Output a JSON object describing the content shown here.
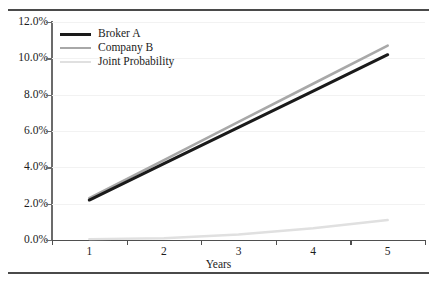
{
  "chart_data": {
    "type": "line",
    "title": "",
    "xlabel": "Years",
    "ylabel": "",
    "categories": [
      "1",
      "2",
      "3",
      "4",
      "5"
    ],
    "x": [
      1,
      2,
      3,
      4,
      5
    ],
    "ylim": [
      0,
      12
    ],
    "ytick_labels": [
      "12.0%",
      "10.0%",
      "8.0%",
      "6.0%",
      "4.0%",
      "2.0%",
      "0.0%"
    ],
    "ytick_values": [
      12,
      10,
      8,
      6,
      4,
      2,
      0
    ],
    "grid": true,
    "legend_position": "top-left",
    "value_unit": "percent",
    "series": [
      {
        "name": "Broker A",
        "color": "#1a1a1a",
        "width": 3.0,
        "values": [
          2.2,
          4.2,
          6.2,
          8.2,
          10.2
        ]
      },
      {
        "name": "Company B",
        "color": "#a8a8a8",
        "width": 2.6,
        "values": [
          2.3,
          4.4,
          6.5,
          8.6,
          10.7
        ]
      },
      {
        "name": "Joint Probability",
        "color": "#e0e0e0",
        "width": 2.4,
        "values": [
          0.05,
          0.1,
          0.3,
          0.65,
          1.1
        ]
      }
    ]
  },
  "figure": {
    "rule_color": "#4a4a4a",
    "axis_color": "#4f4f4f",
    "grid_color": "#f2f2f2",
    "background": "#ffffff"
  }
}
